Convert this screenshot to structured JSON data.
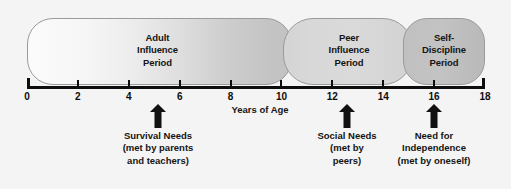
{
  "figure": {
    "background_color": "#f4f4f4",
    "axis_color": "#0d0d0d",
    "bubble_border_color": "#9a9a9a"
  },
  "axis": {
    "title": "Years of Age",
    "min": 0,
    "max": 18,
    "tick_values": [
      0,
      2,
      4,
      6,
      8,
      10,
      12,
      14,
      16,
      18
    ],
    "tick_labels": [
      "0",
      "2",
      "4",
      "6",
      "8",
      "10",
      "12",
      "14",
      "16",
      "18"
    ]
  },
  "periods": [
    {
      "id": "adult",
      "lines": [
        "Adult",
        "Influence",
        "Period"
      ],
      "label": "Adult Influence Period",
      "start_age": 0,
      "end_age": 10.5,
      "fill_start_color": "#fbfbfb",
      "fill_end_color": "#c2c2c2"
    },
    {
      "id": "peer",
      "lines": [
        "Peer",
        "Influence",
        "Period"
      ],
      "label": "Peer Influence Period",
      "start_age": 10.1,
      "end_age": 15.2,
      "fill_start_color": "#d4d4d4",
      "fill_end_color": "#d2d2d2"
    },
    {
      "id": "self",
      "lines": [
        "Self-",
        "Discipline",
        "Period"
      ],
      "label": "Self-Discipline Period",
      "start_age": 14.8,
      "end_age": 18,
      "fill_start_color": "#c0c0c0",
      "fill_end_color": "#b9b9b9"
    }
  ],
  "markers": [
    {
      "id": "survival",
      "age": 5.4,
      "lines": [
        "Survival Needs",
        "(met by parents",
        "and teachers)"
      ],
      "label": "Survival Needs (met by parents and teachers)"
    },
    {
      "id": "social",
      "age": 12.9,
      "lines": [
        "Social Needs",
        "(met by",
        "peers)"
      ],
      "label": "Social Needs (met by peers)"
    },
    {
      "id": "independence",
      "age": 16.4,
      "lines": [
        "Need for",
        "Independence",
        "(met by oneself)"
      ],
      "label": "Need for Independence (met by oneself)"
    }
  ],
  "chart_data": {
    "type": "diagram",
    "title": "",
    "xlabel": "Years of Age",
    "xlim": [
      0,
      18
    ],
    "categories": [
      "Adult Influence Period",
      "Peer Influence Period",
      "Self-Discipline Period"
    ],
    "spans": [
      [
        0,
        10.5
      ],
      [
        10.1,
        15.2
      ],
      [
        14.8,
        18
      ]
    ],
    "annotations": [
      {
        "x": 5.4,
        "text": "Survival Needs (met by parents and teachers)"
      },
      {
        "x": 12.9,
        "text": "Social Needs (met by peers)"
      },
      {
        "x": 16.4,
        "text": "Need for Independence (met by oneself)"
      }
    ],
    "grid": false,
    "legend": "none"
  }
}
